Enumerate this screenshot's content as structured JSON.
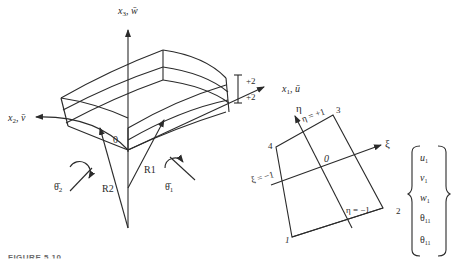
{
  "figure": {
    "caption": "FIGURE 5.10",
    "shell": {
      "axis_x3": {
        "main": "x",
        "sub": "3",
        "bar": "w̄",
        "label": "x3, w̄"
      },
      "axis_x1": {
        "main": "x",
        "sub": "1",
        "bar": "ū",
        "label": "x1, ū"
      },
      "axis_x2": {
        "main": "x",
        "sub": "2",
        "bar": "v̄",
        "label": "x2, v̄"
      },
      "thickness_top": "+2",
      "thickness_bottom": "+2",
      "origin": "0",
      "radius_1": "R1",
      "radius_2": "R2",
      "rotation_1": {
        "main": "θ̄",
        "sub": "1"
      },
      "rotation_2": {
        "main": "θ̄",
        "sub": "2"
      }
    },
    "element": {
      "eta_axis": "η",
      "xi_axis": "ξ",
      "eta_plus": "η = +1",
      "eta_minus": "η = −1",
      "xi_minus": "ξ = −1",
      "origin": "0",
      "nodes": [
        "1",
        "2",
        "3",
        "4"
      ]
    },
    "dof_vector": [
      {
        "main": "u",
        "sub": "1"
      },
      {
        "main": "v",
        "sub": "1"
      },
      {
        "main": "w",
        "sub": "1"
      },
      {
        "main": "θ",
        "sub": "11"
      },
      {
        "main": "θ",
        "sub": "11"
      }
    ]
  }
}
